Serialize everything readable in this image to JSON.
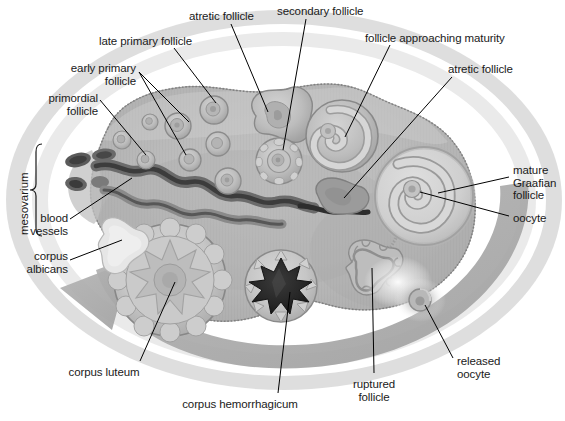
{
  "figure": {
    "type": "anatomical-diagram"
  },
  "colors": {
    "page_background": "#ffffff",
    "outer_ring": "#c9c9c9",
    "outer_ring_inner": "#dcdcdc",
    "stroma_light": "#c3c3c3",
    "stroma_mid": "#b2b2b2",
    "stroma_dark": "#9d9d9d",
    "cortex_pale": "#d2d2d2",
    "follicle_fill": "#c0c0c0",
    "follicle_rim": "#9a9a9a",
    "antrum_pale": "#d9d9d9",
    "corpus_luteum": "#c6c6c6",
    "corpus_albicans": "#e4e4e4",
    "hemorrhagicum": "#2a2a2a",
    "vessel_dark": "#5d5d5d",
    "vessel_mid": "#8a8a8a",
    "arrow_band": "#a9a9a9",
    "leader_line": "#000000",
    "label_text": "#1a1a1a"
  },
  "labels": [
    {
      "id": "primordial-follicle",
      "text": "primordial\nfollicle",
      "align": "right",
      "x": 14,
      "y": 92,
      "w": 84
    },
    {
      "id": "early-primary-follicle",
      "text": "early primary\nfollicle",
      "align": "right",
      "x": 52,
      "y": 62,
      "w": 84
    },
    {
      "id": "late-primary-follicle",
      "text": "late primary follicle",
      "align": "left",
      "x": 99,
      "y": 35,
      "w": 122
    },
    {
      "id": "atretic-follicle-top",
      "text": "atretic follicle",
      "align": "left",
      "x": 189,
      "y": 10,
      "w": 84
    },
    {
      "id": "secondary-follicle",
      "text": "secondary follicle",
      "align": "left",
      "x": 277,
      "y": 5,
      "w": 110
    },
    {
      "id": "follicle-approaching-maturity",
      "text": "follicle approaching maturity",
      "align": "left",
      "x": 365,
      "y": 32,
      "w": 182
    },
    {
      "id": "atretic-follicle-right",
      "text": "atretic follicle",
      "align": "left",
      "x": 448,
      "y": 63,
      "w": 88
    },
    {
      "id": "mature-graafian-follicle",
      "text": "mature\nGraafian\nfollicle",
      "align": "left",
      "x": 513,
      "y": 164,
      "w": 52
    },
    {
      "id": "oocyte",
      "text": "oocyte",
      "align": "left",
      "x": 513,
      "y": 212,
      "w": 50
    },
    {
      "id": "released-oocyte",
      "text": "released\noocyte",
      "align": "left",
      "x": 457,
      "y": 355,
      "w": 66
    },
    {
      "id": "ruptured-follicle",
      "text": "ruptured\nfollicle",
      "align": "center",
      "x": 337,
      "y": 378,
      "w": 74
    },
    {
      "id": "corpus-hemorrhagicum",
      "text": "corpus hemorrhagicum",
      "align": "center",
      "x": 160,
      "y": 398,
      "w": 160
    },
    {
      "id": "corpus-luteum",
      "text": "corpus luteum",
      "align": "center",
      "x": 57,
      "y": 366,
      "w": 94
    },
    {
      "id": "corpus-albicans",
      "text": "corpus\nalbicans",
      "align": "right",
      "x": 8,
      "y": 250,
      "w": 60
    },
    {
      "id": "blood-vessels",
      "text": "blood\nvessels",
      "align": "right",
      "x": 8,
      "y": 212,
      "w": 60
    }
  ],
  "vertical_label": {
    "id": "mesovarium",
    "text": "mesovarium",
    "x": 18,
    "y": 200
  },
  "structures": [
    {
      "id": "ovary-body",
      "name": "ovary cross-section",
      "note": "lumpy ovoid body of the ovary, gray stroma with vertical striations"
    },
    {
      "id": "cycle-arrow",
      "name": "ovarian cycle arrow",
      "note": "thick gray ring arrow running counter-clockwise around the ovary, arrowhead at lower left"
    },
    {
      "id": "outer-ring",
      "name": "outer halo ring",
      "note": "pale gray annulus surrounding the ovary"
    },
    {
      "id": "hilum-vessels",
      "name": "hilum blood vessels",
      "note": "coiled dark vessels entering at mesovarium"
    },
    {
      "id": "primordial-follicles",
      "name": "primordial follicles",
      "count": 3
    },
    {
      "id": "primary-follicles",
      "name": "primary follicles",
      "count": 5
    },
    {
      "id": "secondary-follicle",
      "name": "secondary follicle",
      "count": 1
    },
    {
      "id": "atretic-follicles",
      "name": "atretic follicles",
      "count": 2
    },
    {
      "id": "antral-follicle",
      "name": "follicle approaching maturity",
      "count": 1
    },
    {
      "id": "graafian-follicle",
      "name": "mature Graafian follicle",
      "count": 1
    },
    {
      "id": "ruptured-follicle",
      "name": "ruptured follicle",
      "count": 1
    },
    {
      "id": "released-oocyte",
      "name": "released oocyte",
      "count": 1
    },
    {
      "id": "corpus-hemorrhagicum",
      "name": "corpus hemorrhagicum",
      "count": 1
    },
    {
      "id": "corpus-luteum",
      "name": "corpus luteum",
      "count": 1
    },
    {
      "id": "corpus-albicans",
      "name": "corpus albicans",
      "count": 1
    }
  ]
}
